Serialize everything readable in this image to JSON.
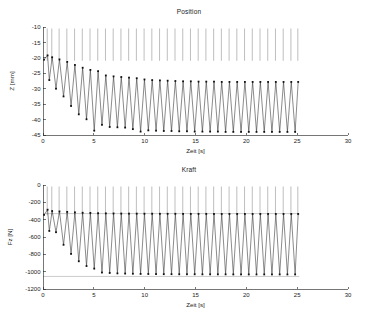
{
  "figure": {
    "width": 378,
    "height": 318,
    "background": "#ffffff",
    "line_color": "#2b2b2b",
    "spike_color": "#7d7d7d",
    "marker_color": "#111111"
  },
  "panels": {
    "position": {
      "title": "Position",
      "xlabel": "Zeit [s]",
      "ylabel": "Z [mm]",
      "xticks": [
        "0",
        "5",
        "10",
        "15",
        "20",
        "25",
        "30"
      ],
      "yticks": [
        "-10",
        "-15",
        "-20",
        "-25",
        "-30",
        "-35",
        "-40",
        "-45"
      ]
    },
    "kraft": {
      "title": "Kraft",
      "xlabel": "Zeit [s]",
      "ylabel": "Fz [N]",
      "xticks": [
        "0",
        "5",
        "10",
        "15",
        "20",
        "25",
        "30"
      ],
      "yticks": [
        "0",
        "-200",
        "-400",
        "-600",
        "-800",
        "-1000",
        "-1200"
      ]
    }
  },
  "chart_data": [
    {
      "type": "line",
      "title": "Position",
      "xlabel": "Zeit [s]",
      "ylabel": "Z [mm]",
      "xlim": [
        0,
        30
      ],
      "ylim": [
        -45,
        -10
      ],
      "xticks": [
        0,
        5,
        10,
        15,
        20,
        25,
        30
      ],
      "yticks": [
        -10,
        -15,
        -20,
        -25,
        -30,
        -35,
        -40,
        -45
      ],
      "grid": false,
      "legend": false,
      "data_x_range": [
        0,
        25.2
      ],
      "description": "Sawtooth-like oscillation of vertical position with transient decay: upper turning points drift from about -19 mm down to a steady -27.8 mm while lower turning points drop from about -27 mm to a steady -44 mm. Period about 0.8 s. Thin light-grey vertical retrace lines run from each cycle top up to the top of the axes.",
      "cycle_period_s": 0.8,
      "peaks": [
        {
          "t": 0.1,
          "z": -20.6
        },
        {
          "t": 0.45,
          "z": -19.2
        },
        {
          "t": 0.9,
          "z": -19.8
        },
        {
          "t": 1.62,
          "z": -20.5
        },
        {
          "t": 2.38,
          "z": -21.3
        },
        {
          "t": 3.14,
          "z": -22.3
        },
        {
          "t": 3.9,
          "z": -23.2
        },
        {
          "t": 4.66,
          "z": -23.9
        },
        {
          "t": 5.42,
          "z": -24.3
        },
        {
          "t": 6.18,
          "z": -25.7
        },
        {
          "t": 6.94,
          "z": -26.0
        },
        {
          "t": 7.7,
          "z": -26.2
        },
        {
          "t": 8.46,
          "z": -26.4
        },
        {
          "t": 9.22,
          "z": -26.6
        },
        {
          "t": 9.98,
          "z": -27.0
        },
        {
          "t": 10.74,
          "z": -27.2
        },
        {
          "t": 11.5,
          "z": -27.3
        },
        {
          "t": 12.26,
          "z": -27.4
        },
        {
          "t": 13.02,
          "z": -27.5
        },
        {
          "t": 13.78,
          "z": -27.6
        },
        {
          "t": 14.54,
          "z": -27.6
        },
        {
          "t": 15.3,
          "z": -27.7
        },
        {
          "t": 16.06,
          "z": -27.7
        },
        {
          "t": 16.82,
          "z": -27.7
        },
        {
          "t": 17.58,
          "z": -27.8
        },
        {
          "t": 18.34,
          "z": -27.8
        },
        {
          "t": 19.1,
          "z": -27.8
        },
        {
          "t": 19.86,
          "z": -27.8
        },
        {
          "t": 20.62,
          "z": -27.8
        },
        {
          "t": 21.38,
          "z": -27.8
        },
        {
          "t": 22.14,
          "z": -27.8
        },
        {
          "t": 22.9,
          "z": -27.8
        },
        {
          "t": 23.66,
          "z": -27.8
        },
        {
          "t": 24.42,
          "z": -27.8
        },
        {
          "t": 25.1,
          "z": -27.8
        }
      ],
      "valleys": [
        {
          "t": 0.62,
          "z": -27.2
        },
        {
          "t": 1.28,
          "z": -30.0
        },
        {
          "t": 2.02,
          "z": -32.5
        },
        {
          "t": 2.76,
          "z": -35.6
        },
        {
          "t": 3.52,
          "z": -38.3
        },
        {
          "t": 4.28,
          "z": -39.9
        },
        {
          "t": 5.04,
          "z": -43.6
        },
        {
          "t": 5.8,
          "z": -41.7
        },
        {
          "t": 6.56,
          "z": -42.4
        },
        {
          "t": 7.32,
          "z": -42.5
        },
        {
          "t": 8.08,
          "z": -42.6
        },
        {
          "t": 8.84,
          "z": -43.1
        },
        {
          "t": 9.6,
          "z": -43.9
        },
        {
          "t": 10.36,
          "z": -43.5
        },
        {
          "t": 11.12,
          "z": -43.6
        },
        {
          "t": 11.88,
          "z": -43.7
        },
        {
          "t": 12.64,
          "z": -43.7
        },
        {
          "t": 13.4,
          "z": -43.8
        },
        {
          "t": 14.16,
          "z": -43.8
        },
        {
          "t": 14.92,
          "z": -43.9
        },
        {
          "t": 15.68,
          "z": -43.9
        },
        {
          "t": 16.44,
          "z": -43.9
        },
        {
          "t": 17.2,
          "z": -43.9
        },
        {
          "t": 17.96,
          "z": -44.0
        },
        {
          "t": 18.72,
          "z": -44.0
        },
        {
          "t": 19.48,
          "z": -44.0
        },
        {
          "t": 20.24,
          "z": -44.0
        },
        {
          "t": 21.0,
          "z": -44.0
        },
        {
          "t": 21.76,
          "z": -44.0
        },
        {
          "t": 22.52,
          "z": -44.0
        },
        {
          "t": 23.28,
          "z": -44.0
        },
        {
          "t": 24.04,
          "z": -44.0
        },
        {
          "t": 24.8,
          "z": -44.0
        }
      ]
    },
    {
      "type": "line",
      "title": "Kraft",
      "xlabel": "Zeit [s]",
      "ylabel": "Fz [N]",
      "xlim": [
        0,
        30
      ],
      "ylim": [
        -1200,
        0
      ],
      "xticks": [
        0,
        5,
        10,
        15,
        20,
        25,
        30
      ],
      "yticks": [
        0,
        -200,
        -400,
        -600,
        -800,
        -1000,
        -1200
      ],
      "grid": false,
      "legend": false,
      "data_x_range": [
        0,
        25.2
      ],
      "description": "Vertical force oscillation with transient decay. Upper turning points settle near -330 N (a horizontal grey reference line is drawn at that level) and lower turning points deepen from about -530 N toward a steady -1030 N (a second grey reference line sits near -1055 N). Period about 0.8 s. Thin light-grey vertical retrace lines reach the top of the axes.",
      "cycle_period_s": 0.8,
      "reference_lines": [
        -330,
        -1055
      ],
      "peaks": [
        {
          "t": 0.1,
          "fz": -345
        },
        {
          "t": 0.45,
          "fz": -285
        },
        {
          "t": 0.9,
          "fz": -300
        },
        {
          "t": 1.62,
          "fz": -305
        },
        {
          "t": 2.38,
          "fz": -310
        },
        {
          "t": 3.14,
          "fz": -315
        },
        {
          "t": 3.9,
          "fz": -320
        },
        {
          "t": 4.66,
          "fz": -322
        },
        {
          "t": 5.42,
          "fz": -325
        },
        {
          "t": 6.18,
          "fz": -327
        },
        {
          "t": 6.94,
          "fz": -328
        },
        {
          "t": 7.7,
          "fz": -329
        },
        {
          "t": 8.46,
          "fz": -330
        },
        {
          "t": 9.22,
          "fz": -330
        },
        {
          "t": 9.98,
          "fz": -331
        },
        {
          "t": 10.74,
          "fz": -331
        },
        {
          "t": 11.5,
          "fz": -332
        },
        {
          "t": 12.26,
          "fz": -332
        },
        {
          "t": 13.02,
          "fz": -332
        },
        {
          "t": 13.78,
          "fz": -333
        },
        {
          "t": 14.54,
          "fz": -333
        },
        {
          "t": 15.3,
          "fz": -333
        },
        {
          "t": 16.06,
          "fz": -333
        },
        {
          "t": 16.82,
          "fz": -334
        },
        {
          "t": 17.58,
          "fz": -334
        },
        {
          "t": 18.34,
          "fz": -334
        },
        {
          "t": 19.1,
          "fz": -334
        },
        {
          "t": 19.86,
          "fz": -334
        },
        {
          "t": 20.62,
          "fz": -334
        },
        {
          "t": 21.38,
          "fz": -334
        },
        {
          "t": 22.14,
          "fz": -334
        },
        {
          "t": 22.9,
          "fz": -334
        },
        {
          "t": 23.66,
          "fz": -334
        },
        {
          "t": 24.42,
          "fz": -334
        },
        {
          "t": 25.1,
          "fz": -334
        }
      ],
      "valleys": [
        {
          "t": 0.62,
          "fz": -530
        },
        {
          "t": 1.28,
          "fz": -545
        },
        {
          "t": 2.02,
          "fz": -690
        },
        {
          "t": 2.76,
          "fz": -795
        },
        {
          "t": 3.52,
          "fz": -880
        },
        {
          "t": 4.28,
          "fz": -935
        },
        {
          "t": 5.04,
          "fz": -965
        },
        {
          "t": 5.8,
          "fz": -1010
        },
        {
          "t": 6.56,
          "fz": -1015
        },
        {
          "t": 7.32,
          "fz": -1020
        },
        {
          "t": 8.08,
          "fz": -1022
        },
        {
          "t": 8.84,
          "fz": -1024
        },
        {
          "t": 9.6,
          "fz": -1026
        },
        {
          "t": 10.36,
          "fz": -1027
        },
        {
          "t": 11.12,
          "fz": -1028
        },
        {
          "t": 11.88,
          "fz": -1029
        },
        {
          "t": 12.64,
          "fz": -1029
        },
        {
          "t": 13.4,
          "fz": -1030
        },
        {
          "t": 14.16,
          "fz": -1030
        },
        {
          "t": 14.92,
          "fz": -1030
        },
        {
          "t": 15.68,
          "fz": -1031
        },
        {
          "t": 16.44,
          "fz": -1031
        },
        {
          "t": 17.2,
          "fz": -1031
        },
        {
          "t": 17.96,
          "fz": -1031
        },
        {
          "t": 18.72,
          "fz": -1032
        },
        {
          "t": 19.48,
          "fz": -1032
        },
        {
          "t": 20.24,
          "fz": -1032
        },
        {
          "t": 21.0,
          "fz": -1032
        },
        {
          "t": 21.76,
          "fz": -1032
        },
        {
          "t": 22.52,
          "fz": -1032
        },
        {
          "t": 23.28,
          "fz": -1032
        },
        {
          "t": 24.04,
          "fz": -1032
        },
        {
          "t": 24.8,
          "fz": -1032
        }
      ]
    }
  ]
}
